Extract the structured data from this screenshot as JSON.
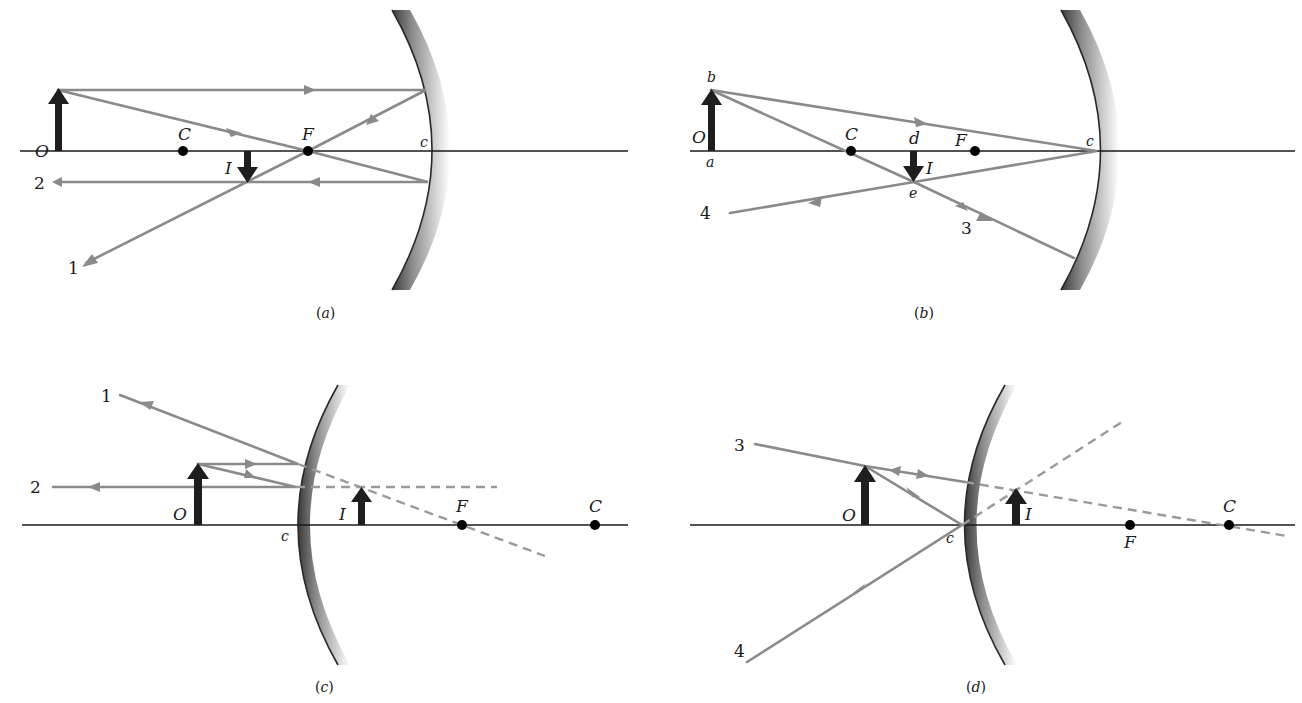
{
  "figure": {
    "colors": {
      "ray": "#8a8a8a",
      "object_arrow": "#1e1e1e",
      "axis": "#1a1a1a",
      "mirror_edge": "#2a2a2a",
      "mirror_shade": "#bdbdbd"
    },
    "panels": [
      {
        "id": "a",
        "caption": "a",
        "mirror": "concave",
        "labels": {
          "object": "O",
          "center": "C",
          "focus": "F",
          "vertex": "c",
          "image": "I"
        },
        "ray_labels": [
          "1",
          "2"
        ]
      },
      {
        "id": "b",
        "caption": "b",
        "mirror": "concave",
        "labels": {
          "object": "O",
          "center": "C",
          "focus": "F",
          "vertex": "c",
          "image": "I",
          "object_base": "a",
          "object_tip": "b",
          "image_base": "d",
          "image_tip": "e"
        },
        "ray_labels": [
          "3",
          "4"
        ]
      },
      {
        "id": "c",
        "caption": "c",
        "mirror": "convex",
        "labels": {
          "object": "O",
          "center": "C",
          "focus": "F",
          "vertex": "c",
          "image": "I"
        },
        "ray_labels": [
          "1",
          "2"
        ]
      },
      {
        "id": "d",
        "caption": "d",
        "mirror": "convex",
        "labels": {
          "object": "O",
          "center": "C",
          "focus": "F",
          "vertex": "c",
          "image": "I"
        },
        "ray_labels": [
          "3",
          "4"
        ]
      }
    ]
  }
}
